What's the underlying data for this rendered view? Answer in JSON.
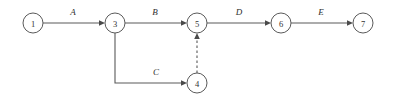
{
  "diagram": {
    "type": "activity-on-arrow-network",
    "canvas": {
      "width": 396,
      "height": 101,
      "background": "#ffffff"
    },
    "style": {
      "stroke_color": "#5a5a5a",
      "arrowhead_color": "#4a4a4a",
      "node_fill": "#ffffff",
      "label_color": "#2e2e2e",
      "node_radius": 10
    },
    "nodes": [
      {
        "id": "1",
        "label": "1",
        "cx": 33,
        "cy": 23
      },
      {
        "id": "3",
        "label": "3",
        "cx": 115,
        "cy": 23
      },
      {
        "id": "5",
        "label": "5",
        "cx": 197,
        "cy": 23
      },
      {
        "id": "6",
        "label": "6",
        "cx": 281,
        "cy": 23
      },
      {
        "id": "7",
        "label": "7",
        "cx": 363,
        "cy": 23
      },
      {
        "id": "4",
        "label": "4",
        "cx": 197,
        "cy": 83
      }
    ],
    "edges": [
      {
        "id": "A",
        "label": "A",
        "from": "1",
        "to": "3",
        "style": "solid",
        "label_x": 73,
        "label_y": 15
      },
      {
        "id": "B",
        "label": "B",
        "from": "3",
        "to": "5",
        "style": "solid",
        "label_x": 155,
        "label_y": 15
      },
      {
        "id": "D",
        "label": "D",
        "from": "5",
        "to": "6",
        "style": "solid",
        "label_x": 239,
        "label_y": 15
      },
      {
        "id": "E",
        "label": "E",
        "from": "6",
        "to": "7",
        "style": "solid",
        "label_x": 321,
        "label_y": 15
      },
      {
        "id": "C",
        "label": "C",
        "from": "3",
        "to": "4",
        "style": "solid",
        "label_x": 156,
        "label_y": 75
      },
      {
        "id": "dummy",
        "label": "",
        "from": "4",
        "to": "5",
        "style": "dashed",
        "label_x": 0,
        "label_y": 0
      }
    ]
  }
}
